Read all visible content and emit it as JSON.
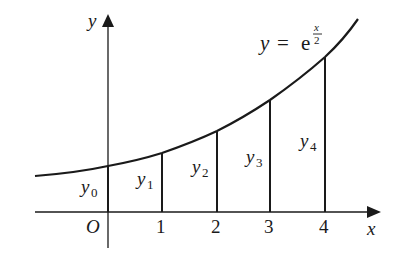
{
  "diagram": {
    "function_label": {
      "lhs": "y",
      "eq": "=",
      "base": "e",
      "exp_num": "x",
      "exp_den": "2"
    },
    "axes": {
      "x_label": "x",
      "y_label": "y",
      "origin_label": "O"
    },
    "x_ticks": [
      "1",
      "2",
      "3",
      "4"
    ],
    "ordinates": [
      {
        "sym": "y",
        "sub": "0"
      },
      {
        "sym": "y",
        "sub": "1"
      },
      {
        "sym": "y",
        "sub": "2"
      },
      {
        "sym": "y",
        "sub": "3"
      },
      {
        "sym": "y",
        "sub": "4"
      }
    ],
    "colors": {
      "stroke": "#1a1a1a",
      "background": "#ffffff"
    }
  }
}
